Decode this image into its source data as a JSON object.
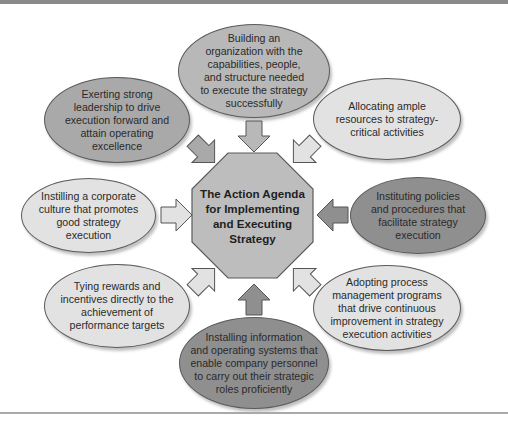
{
  "diagram": {
    "center": {
      "label": "The Action Agenda for Implementing and Executing Strategy",
      "lines": [
        "The Action Agenda",
        "for Implementing",
        "and Executing",
        "Strategy"
      ],
      "shape": "octagon",
      "fill": "#bdbdbd"
    },
    "nodes": [
      {
        "id": "top",
        "position": "top",
        "fill": "#b8b8b8",
        "lines": [
          "Building an",
          "organization with the",
          "capabilities, people,",
          "and structure needed",
          "to execute the strategy",
          "successfully"
        ]
      },
      {
        "id": "top-left",
        "position": "top-left",
        "fill": "#a9a9a9",
        "lines": [
          "Exerting strong",
          "leadership to drive",
          "execution forward and",
          "attain operating",
          "excellence"
        ]
      },
      {
        "id": "top-right",
        "position": "top-right",
        "fill": "#e2e2e2",
        "lines": [
          "Allocating ample",
          "resources to strategy-",
          "critical activities"
        ]
      },
      {
        "id": "left",
        "position": "left",
        "fill": "#e2e2e2",
        "lines": [
          "Instilling a corporate",
          "culture that promotes",
          "good strategy",
          "execution"
        ]
      },
      {
        "id": "right",
        "position": "right",
        "fill": "#8f8f8f",
        "lines": [
          "Instituting policies",
          "and procedures that",
          "facilitate strategy",
          "execution"
        ]
      },
      {
        "id": "bottom-left",
        "position": "bottom-left",
        "fill": "#e2e2e2",
        "lines": [
          "Tying rewards and",
          "incentives directly to the",
          "achievement of",
          "performance targets"
        ]
      },
      {
        "id": "bottom-right",
        "position": "bottom-right",
        "fill": "#e2e2e2",
        "lines": [
          "Adopting process",
          "management programs",
          "that drive continuous",
          "improvement in strategy",
          "execution activities"
        ]
      },
      {
        "id": "bottom",
        "position": "bottom",
        "fill": "#8f8f8f",
        "lines": [
          "Installing information",
          "and operating systems that",
          "enable company personnel",
          "to carry out their strategic",
          "roles proficiently"
        ]
      }
    ],
    "edges": [
      {
        "from": "top",
        "to": "center",
        "arrow": "arrow-down"
      },
      {
        "from": "top-left",
        "to": "center",
        "arrow": "arrow-down-right"
      },
      {
        "from": "top-right",
        "to": "center",
        "arrow": "arrow-down-left"
      },
      {
        "from": "left",
        "to": "center",
        "arrow": "arrow-right"
      },
      {
        "from": "right",
        "to": "center",
        "arrow": "arrow-left"
      },
      {
        "from": "bottom-left",
        "to": "center",
        "arrow": "arrow-up-right"
      },
      {
        "from": "bottom-right",
        "to": "center",
        "arrow": "arrow-up-left"
      },
      {
        "from": "bottom",
        "to": "center",
        "arrow": "arrow-up"
      }
    ]
  }
}
